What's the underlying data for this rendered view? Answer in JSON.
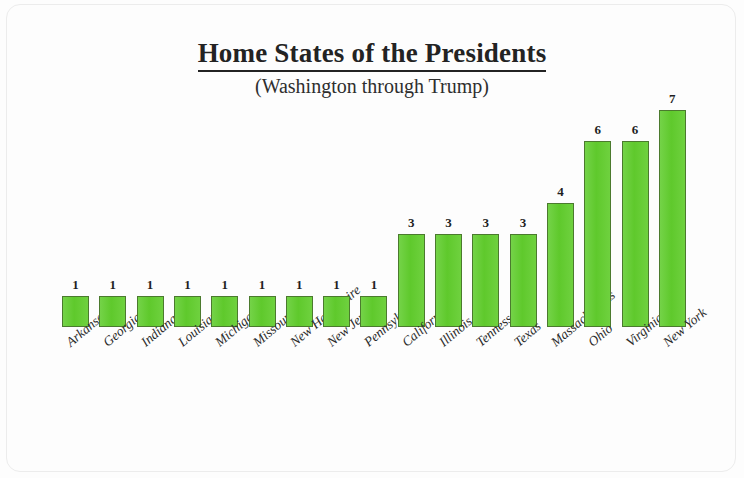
{
  "chart_data": {
    "type": "bar",
    "title": "Home States of the Presidents",
    "subtitle": "(Washington through Trump)",
    "xlabel": "",
    "ylabel": "",
    "ylim": [
      0,
      7
    ],
    "grid": false,
    "legend": "none",
    "bar_color": "#64cc33",
    "bar_border_color": "#4b7a2e",
    "categories": [
      "Arkansas",
      "Georgia",
      "Indiana",
      "Louisiana",
      "Michigan",
      "Missouri",
      "New Hampshire",
      "New Jersey",
      "Pennsylvania",
      "California",
      "Illinois",
      "Tennessee",
      "Texas",
      "Massachusetts",
      "Ohio",
      "Virginia",
      "New York"
    ],
    "values": [
      1,
      1,
      1,
      1,
      1,
      1,
      1,
      1,
      1,
      3,
      3,
      3,
      3,
      4,
      6,
      6,
      7
    ],
    "data_labels": [
      "1",
      "1",
      "1",
      "1",
      "1",
      "1",
      "1",
      "1",
      "1",
      "3",
      "3",
      "3",
      "3",
      "4",
      "6",
      "6",
      "7"
    ]
  }
}
